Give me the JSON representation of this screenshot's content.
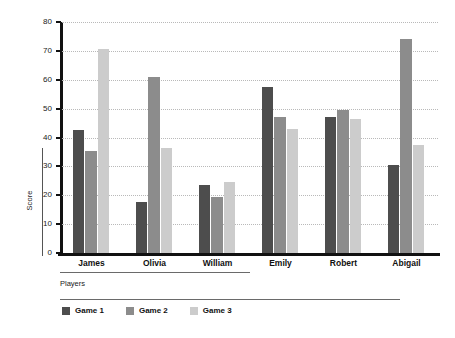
{
  "chart_data": {
    "type": "bar",
    "title": "",
    "xlabel": "Players",
    "ylabel": "Score",
    "ylim": [
      0,
      80
    ],
    "yticks": [
      0,
      10,
      20,
      30,
      40,
      50,
      60,
      70,
      80
    ],
    "grid": true,
    "legend_position": "bottom-left",
    "categories": [
      "James",
      "Olivia",
      "William",
      "Emily",
      "Robert",
      "Abigail"
    ],
    "series": [
      {
        "name": "Game 1",
        "color": "#4d4d4d",
        "values": [
          42.5,
          17.5,
          23.5,
          57.5,
          47,
          30.5
        ]
      },
      {
        "name": "Game 2",
        "color": "#8c8c8c",
        "values": [
          35.5,
          61,
          19.5,
          47,
          49.5,
          74
        ]
      },
      {
        "name": "Game 3",
        "color": "#cccccc",
        "values": [
          70.5,
          36.5,
          24.5,
          43,
          46.5,
          37.5
        ]
      }
    ]
  },
  "axes": {
    "y_title": "Score",
    "x_title": "Players",
    "y_tick_labels": [
      "0",
      "10",
      "20",
      "30",
      "40",
      "50",
      "60",
      "70",
      "80"
    ]
  },
  "legend": {
    "items": [
      {
        "label": "Game 1",
        "color": "#4d4d4d"
      },
      {
        "label": "Game 2",
        "color": "#8c8c8c"
      },
      {
        "label": "Game 3",
        "color": "#cccccc"
      }
    ]
  }
}
